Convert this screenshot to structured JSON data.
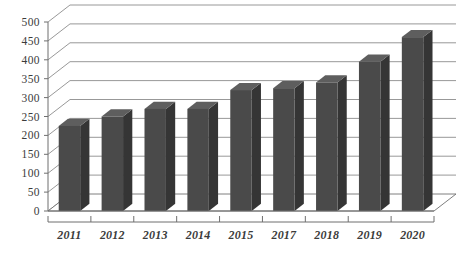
{
  "chart_data": {
    "type": "bar",
    "title": "",
    "subtitle": "",
    "xlabel": "",
    "ylabel": "",
    "categories": [
      "2011",
      "2012",
      "2013",
      "2014",
      "2015",
      "2017",
      "2018",
      "2019",
      "2020"
    ],
    "values": [
      225,
      250,
      270,
      270,
      320,
      325,
      340,
      395,
      460
    ],
    "ylim": [
      0,
      500
    ],
    "ytick_step": 50,
    "yticks": [
      "0",
      "50",
      "100",
      "150",
      "200",
      "250",
      "300",
      "350",
      "400",
      "450",
      "500"
    ],
    "grid": true,
    "legend": "none",
    "style": "3d-column",
    "colors": {
      "bar_front": "#4a4a4a",
      "bar_side": "#353535",
      "bar_top": "#5e5e5e",
      "gridline": "#8c8c8c",
      "axis": "#6f6f6f",
      "background": "#ffffff",
      "text": "#3b3b3b"
    }
  },
  "axes": {
    "y_axis_name": "value-axis",
    "x_axis_name": "category-axis"
  }
}
